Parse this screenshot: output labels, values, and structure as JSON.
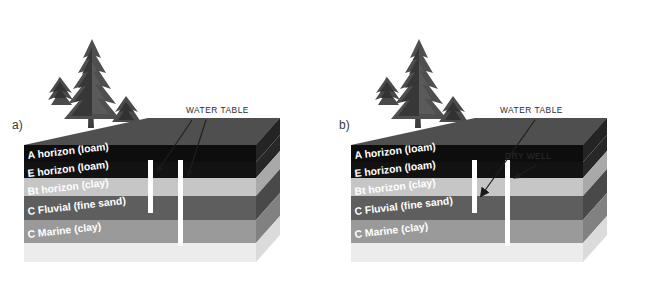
{
  "figure": {
    "background": "#ffffff",
    "panels": [
      {
        "id": "a",
        "label": "a)",
        "annotations": [
          {
            "name": "water-table",
            "text": "WATER TABLE",
            "x": 186,
            "y": 113
          }
        ],
        "wells": [
          {
            "name": "shallow-well",
            "state": "water",
            "depth": "shallow"
          },
          {
            "name": "deep-well",
            "state": "water",
            "depth": "deep"
          }
        ]
      },
      {
        "id": "b",
        "label": "b)",
        "annotations": [
          {
            "name": "water-table",
            "text": "WATER TABLE",
            "x": 500,
            "y": 113
          },
          {
            "name": "dry-well",
            "text": "DRY WELL",
            "x": 505,
            "y": 159
          }
        ],
        "wells": [
          {
            "name": "dry-well",
            "state": "dry",
            "depth": "shallow"
          },
          {
            "name": "deep-well",
            "state": "water",
            "depth": "deep"
          }
        ]
      }
    ],
    "horizons": [
      {
        "code": "A",
        "name": "A horizon (loam)",
        "front": "#0d0d0d",
        "side": "#262626",
        "top": "#4f4f4f"
      },
      {
        "code": "E",
        "name": "E horizon (loam)",
        "front": "#111111",
        "side": "#2a2a2a",
        "top": "#4f4f4f"
      },
      {
        "code": "Bt",
        "name": "Bt horizon (clay)",
        "front": "#c6c6c6",
        "side": "#ababab",
        "top": "#c6c6c6"
      },
      {
        "code": "C",
        "name": "C Fluvial (fine sand)",
        "front": "#5e5e5e",
        "side": "#4a4a4a",
        "top": "#5e5e5e"
      },
      {
        "code": "C",
        "name": "C Marine (clay)",
        "front": "#9a9a9a",
        "side": "#828282",
        "top": "#9a9a9a"
      },
      {
        "code": "",
        "name": "",
        "front": "#ededed",
        "side": "#dcdcdc",
        "top": "#ededed"
      }
    ],
    "surface": {
      "name": "ground-surface",
      "color": "#4f4f4f"
    },
    "well_color": "#ffffff",
    "arrow_color": "#1a1a1a",
    "leader_color": "#1f1f1f",
    "tree_color": "#4a4a4a",
    "tree_dark": "#2f2f2f",
    "trunk_color": "#3d3d3d"
  }
}
